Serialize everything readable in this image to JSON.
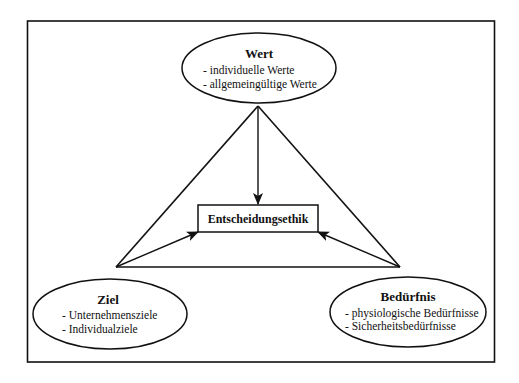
{
  "diagram": {
    "center_box": {
      "label": "Entscheidungsethik"
    },
    "nodes": {
      "wert": {
        "title": "Wert",
        "items": [
          "- individuelle Werte",
          "- allgemeingültige Werte"
        ]
      },
      "ziel": {
        "title": "Ziel",
        "items": [
          "- Unternehmensziele",
          "- Individualziele"
        ]
      },
      "beduerfnis": {
        "title": "Bedürfnis",
        "items": [
          "- physiologische Bedürfnisse",
          "- Sicherheitsbedürfnisse"
        ]
      }
    },
    "edges": [
      {
        "from": "Wert",
        "to": "Entscheidungsethik",
        "type": "arrow"
      },
      {
        "from": "Ziel",
        "to": "Entscheidungsethik",
        "type": "arrow"
      },
      {
        "from": "Bedürfnis",
        "to": "Entscheidungsethik",
        "type": "arrow"
      },
      {
        "from": "Wert",
        "to": "Ziel",
        "type": "line"
      },
      {
        "from": "Wert",
        "to": "Bedürfnis",
        "type": "line"
      },
      {
        "from": "Ziel",
        "to": "Bedürfnis",
        "type": "line"
      }
    ],
    "colors": {
      "stroke": "#111111",
      "background": "#ffffff"
    }
  }
}
